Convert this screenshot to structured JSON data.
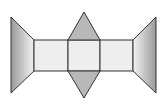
{
  "diagram": {
    "shapes": [
      {
        "name": "left-trapezoid",
        "fill": "gradient-gray"
      },
      {
        "name": "rect-left",
        "fill": "#eeeeee"
      },
      {
        "name": "rect-center",
        "fill": "#eeeeee"
      },
      {
        "name": "rect-right",
        "fill": "#eeeeee"
      },
      {
        "name": "top-triangle",
        "fill": "#b8b8b8"
      },
      {
        "name": "bottom-triangle",
        "fill": "#b8b8b8"
      },
      {
        "name": "right-trapezoid",
        "fill": "gradient-gray"
      }
    ],
    "colors": {
      "stroke": "#333333",
      "face_light": "#eeeeee",
      "face_dark": "#b8b8b8",
      "gradient_dark": "#9a9a9a",
      "gradient_light": "#f2f2f2"
    }
  }
}
